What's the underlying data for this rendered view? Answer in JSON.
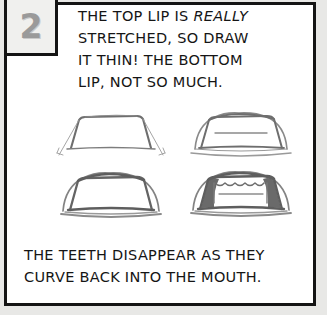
{
  "panel": {
    "number": "2",
    "colors": {
      "border": "#141414",
      "paper": "#ffffff",
      "outer_margin": "#e8e8e6",
      "number_fill": "#9a9a9a",
      "sketch_line": "#6e6e6e",
      "sketch_shadow": "#5a5a5a",
      "text": "#151515"
    }
  },
  "instruction": {
    "lines": [
      {
        "before": "THE TOP LIP IS ",
        "emphasis": "REALLY",
        "after": ""
      },
      {
        "before": "STRETCHED, SO DRAW",
        "emphasis": "",
        "after": ""
      },
      {
        "before": "IT THIN! THE BOTTOM",
        "emphasis": "",
        "after": ""
      },
      {
        "before": "LIP, NOT SO MUCH.",
        "emphasis": "",
        "after": ""
      }
    ],
    "full_text": "THE TOP LIP IS REALLY STRETCHED, SO DRAW IT THIN! THE BOTTOM LIP, NOT SO MUCH."
  },
  "caption": {
    "lines": [
      "THE TEETH DISAPPEAR AS THEY",
      "CURVE BACK INTO THE MOUTH."
    ],
    "full_text": "THE TEETH DISAPPEAR AS THEY CURVE BACK INTO THE MOUTH."
  },
  "sketches": [
    {
      "position": "top-left",
      "name": "mouth-construction-outline",
      "description": "Open trapezoidal mouth construction outline with thin guide lines extending past the corners"
    },
    {
      "position": "top-right",
      "name": "mouth-lips-outline",
      "description": "Mouth shape with upper and lower lip contours drawn around the trapezoid and an inner line"
    },
    {
      "position": "bottom-left",
      "name": "mouth-lips-refined",
      "description": "Refined mouth with thin stretched top lip and fuller bottom lip"
    },
    {
      "position": "bottom-right",
      "name": "mouth-with-teeth-shaded",
      "description": "Mouth with scalloped teeth row and dark shaded corners where teeth curve back"
    }
  ]
}
